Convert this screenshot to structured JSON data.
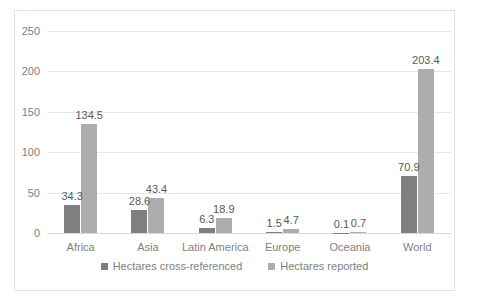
{
  "chart_data": {
    "type": "bar",
    "title": "",
    "xlabel": "",
    "ylabel": "",
    "ylim": [
      0,
      250
    ],
    "yticks": [
      0,
      50,
      100,
      150,
      200,
      250
    ],
    "grid": true,
    "legend_position": "bottom",
    "categories": [
      "Africa",
      "Asia",
      "Latin America",
      "Europe",
      "Oceania",
      "World"
    ],
    "series": [
      {
        "name": "Hectares cross-referenced",
        "color": "#7f7f7f",
        "values": [
          34.3,
          28.6,
          6.3,
          1.5,
          0.1,
          70.9
        ],
        "labels": [
          "34.3",
          "28.6",
          "6.3",
          "1.5",
          "0.1",
          "70.9"
        ]
      },
      {
        "name": "Hectares reported",
        "color": "#adadad",
        "values": [
          134.5,
          43.4,
          18.9,
          4.7,
          0.7,
          203.4
        ],
        "labels": [
          "134.5",
          "43.4",
          "18.9",
          "4.7",
          "0.7",
          "203.4"
        ]
      }
    ]
  },
  "axis": {
    "ytick_labels": [
      "250",
      "200",
      "150",
      "100",
      "50",
      "0"
    ]
  },
  "legend": {
    "items": [
      {
        "label": "Hectares cross-referenced"
      },
      {
        "label": "Hectares reported"
      }
    ]
  }
}
